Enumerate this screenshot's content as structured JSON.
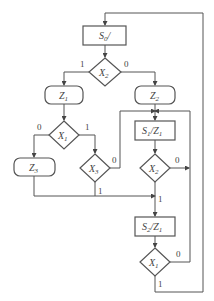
{
  "diagram": {
    "type": "ASM flowchart",
    "nodes": {
      "s0": {
        "kind": "state",
        "label": "S",
        "sub": "0",
        "suffix": "/"
      },
      "x2_top": {
        "kind": "decision",
        "label": "X",
        "sub": "2"
      },
      "z1_cond": {
        "kind": "conditional-output",
        "label": "Z",
        "sub": "1"
      },
      "z2_cond": {
        "kind": "conditional-output",
        "label": "Z",
        "sub": "2"
      },
      "x1_left": {
        "kind": "decision",
        "label": "X",
        "sub": "1"
      },
      "z3_cond": {
        "kind": "conditional-output",
        "label": "Z",
        "sub": "3"
      },
      "x3": {
        "kind": "decision",
        "label": "X",
        "sub": "3"
      },
      "s1": {
        "kind": "state",
        "label": "S",
        "sub": "1",
        "suffix": "/Z",
        "suffix_sub": "1"
      },
      "x2_mid": {
        "kind": "decision",
        "label": "X",
        "sub": "2"
      },
      "s2": {
        "kind": "state",
        "label": "S",
        "sub": "2",
        "suffix": "/Z",
        "suffix_sub": "1"
      },
      "x1_bottom": {
        "kind": "decision",
        "label": "X",
        "sub": "1"
      }
    },
    "edge_labels": {
      "x2_top_left": "1",
      "x2_top_right": "0",
      "x1_left_left": "0",
      "x1_left_right": "1",
      "x3_right": "0",
      "x3_down": "1",
      "x2_mid_right": "0",
      "x2_mid_down": "1",
      "x1_bottom_right": "0",
      "x1_bottom_down": "1"
    },
    "edges": [
      {
        "from": "s0",
        "to": "x2_top"
      },
      {
        "from": "x2_top",
        "to": "z1_cond",
        "label": "1"
      },
      {
        "from": "x2_top",
        "to": "z2_cond",
        "label": "0"
      },
      {
        "from": "z1_cond",
        "to": "x1_left"
      },
      {
        "from": "x1_left",
        "to": "z3_cond",
        "label": "0"
      },
      {
        "from": "x1_left",
        "to": "x3",
        "label": "1"
      },
      {
        "from": "x3",
        "to": "s1",
        "label": "0"
      },
      {
        "from": "x3",
        "to": "s2",
        "label": "1"
      },
      {
        "from": "z3_cond",
        "to": "s2"
      },
      {
        "from": "z2_cond",
        "to": "s1"
      },
      {
        "from": "s1",
        "to": "x2_mid"
      },
      {
        "from": "x2_mid",
        "to": "s1",
        "label": "0"
      },
      {
        "from": "x2_mid",
        "to": "s2",
        "label": "1"
      },
      {
        "from": "s2",
        "to": "x1_bottom"
      },
      {
        "from": "x1_bottom",
        "to": "s1",
        "label": "0"
      },
      {
        "from": "x1_bottom",
        "to": "s0",
        "label": "1"
      }
    ]
  }
}
